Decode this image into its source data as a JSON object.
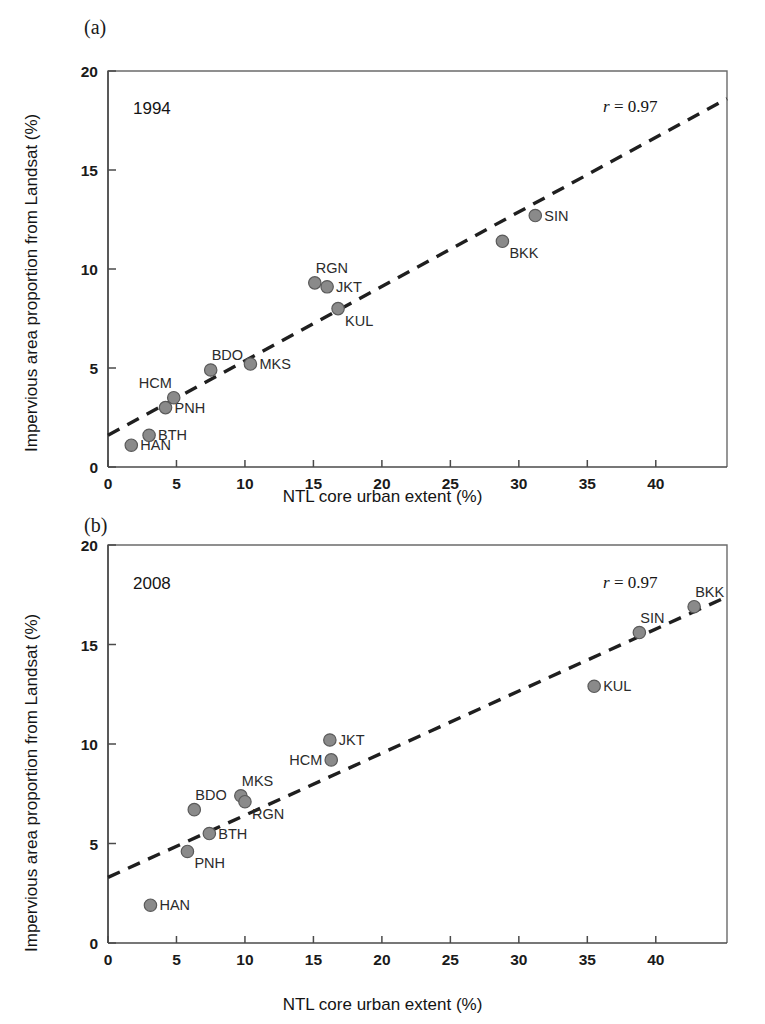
{
  "figure": {
    "background": "#ffffff",
    "marker_color": "#8a8a8a",
    "line_color": "#1f1f1f"
  },
  "panels": [
    {
      "tag": "(a)",
      "year_annotation": "1994",
      "r_prefix": "r",
      "r_value": "= 0.97",
      "xlabel": "NTL core urban extent (%)",
      "ylabel": "Impervious area proportion from Landsat (%)"
    },
    {
      "tag": "(b)",
      "year_annotation": "2008",
      "r_prefix": "r",
      "r_value": "= 0.97",
      "xlabel": "NTL core urban extent (%)",
      "ylabel": "Impervious area proportion from Landsat (%)"
    }
  ],
  "chart_data": [
    {
      "type": "scatter",
      "panel": "(a)",
      "title": "1994",
      "xlabel": "NTL core urban extent (%)",
      "ylabel": "Impervious area proportion from Landsat (%)",
      "xlim": [
        0,
        45.2
      ],
      "ylim": [
        0,
        20
      ],
      "xticks": [
        0,
        5,
        10,
        15,
        20,
        25,
        30,
        35,
        40
      ],
      "yticks": [
        0,
        5,
        10,
        15,
        20
      ],
      "grid": false,
      "legend": "none",
      "annotations": [
        {
          "text": "1994",
          "x": 1.8,
          "y": 18.6
        },
        {
          "text": "r = 0.97",
          "x": 36.5,
          "y": 18.7
        }
      ],
      "correlation_r": 0.97,
      "points": [
        {
          "label": "HAN",
          "x": 1.7,
          "y": 1.1,
          "label_pos": "right"
        },
        {
          "label": "BTH",
          "x": 3.0,
          "y": 1.6,
          "label_pos": "right"
        },
        {
          "label": "PNH",
          "x": 4.2,
          "y": 3.0,
          "label_pos": "right"
        },
        {
          "label": "HCM",
          "x": 4.8,
          "y": 3.5,
          "label_pos": "above-left"
        },
        {
          "label": "BDO",
          "x": 7.5,
          "y": 4.9,
          "label_pos": "above-right"
        },
        {
          "label": "MKS",
          "x": 10.4,
          "y": 5.2,
          "label_pos": "right"
        },
        {
          "label": "RGN",
          "x": 15.1,
          "y": 9.3,
          "label_pos": "above-right"
        },
        {
          "label": "JKT",
          "x": 16.0,
          "y": 9.1,
          "label_pos": "right"
        },
        {
          "label": "KUL",
          "x": 16.8,
          "y": 8.0,
          "label_pos": "below-right"
        },
        {
          "label": "BKK",
          "x": 28.8,
          "y": 11.4,
          "label_pos": "below-right"
        },
        {
          "label": "SIN",
          "x": 31.2,
          "y": 12.7,
          "label_pos": "right"
        }
      ],
      "fit_line": {
        "style": "dashed",
        "x_start": 0.0,
        "y_start": 1.6,
        "x_end": 45.2,
        "y_end": 18.6
      }
    },
    {
      "type": "scatter",
      "panel": "(b)",
      "title": "2008",
      "xlabel": "NTL core urban extent (%)",
      "ylabel": "Impervious area proportion from Landsat (%)",
      "xlim": [
        0,
        45.2
      ],
      "ylim": [
        0,
        20
      ],
      "xticks": [
        0,
        5,
        10,
        15,
        20,
        25,
        30,
        35,
        40
      ],
      "yticks": [
        0,
        5,
        10,
        15,
        20
      ],
      "grid": false,
      "legend": "none",
      "annotations": [
        {
          "text": "2008",
          "x": 1.8,
          "y": 18.6
        },
        {
          "text": "r = 0.97",
          "x": 36.5,
          "y": 18.7
        }
      ],
      "correlation_r": 0.97,
      "points": [
        {
          "label": "HAN",
          "x": 3.1,
          "y": 1.9,
          "label_pos": "right"
        },
        {
          "label": "PNH",
          "x": 5.8,
          "y": 4.6,
          "label_pos": "below-right"
        },
        {
          "label": "BDO",
          "x": 6.3,
          "y": 6.7,
          "label_pos": "above-right"
        },
        {
          "label": "BTH",
          "x": 7.4,
          "y": 5.5,
          "label_pos": "right"
        },
        {
          "label": "MKS",
          "x": 9.7,
          "y": 7.4,
          "label_pos": "above-right"
        },
        {
          "label": "RGN",
          "x": 10.0,
          "y": 7.1,
          "label_pos": "below-right"
        },
        {
          "label": "HCM",
          "x": 16.3,
          "y": 9.2,
          "label_pos": "left"
        },
        {
          "label": "JKT",
          "x": 16.2,
          "y": 10.2,
          "label_pos": "right"
        },
        {
          "label": "KUL",
          "x": 35.5,
          "y": 12.9,
          "label_pos": "right"
        },
        {
          "label": "SIN",
          "x": 38.8,
          "y": 15.6,
          "label_pos": "above-right"
        },
        {
          "label": "BKK",
          "x": 42.8,
          "y": 16.9,
          "label_pos": "above-right"
        }
      ],
      "fit_line": {
        "style": "dashed",
        "x_start": 0.0,
        "y_start": 3.3,
        "x_end": 45.2,
        "y_end": 17.4
      }
    }
  ]
}
